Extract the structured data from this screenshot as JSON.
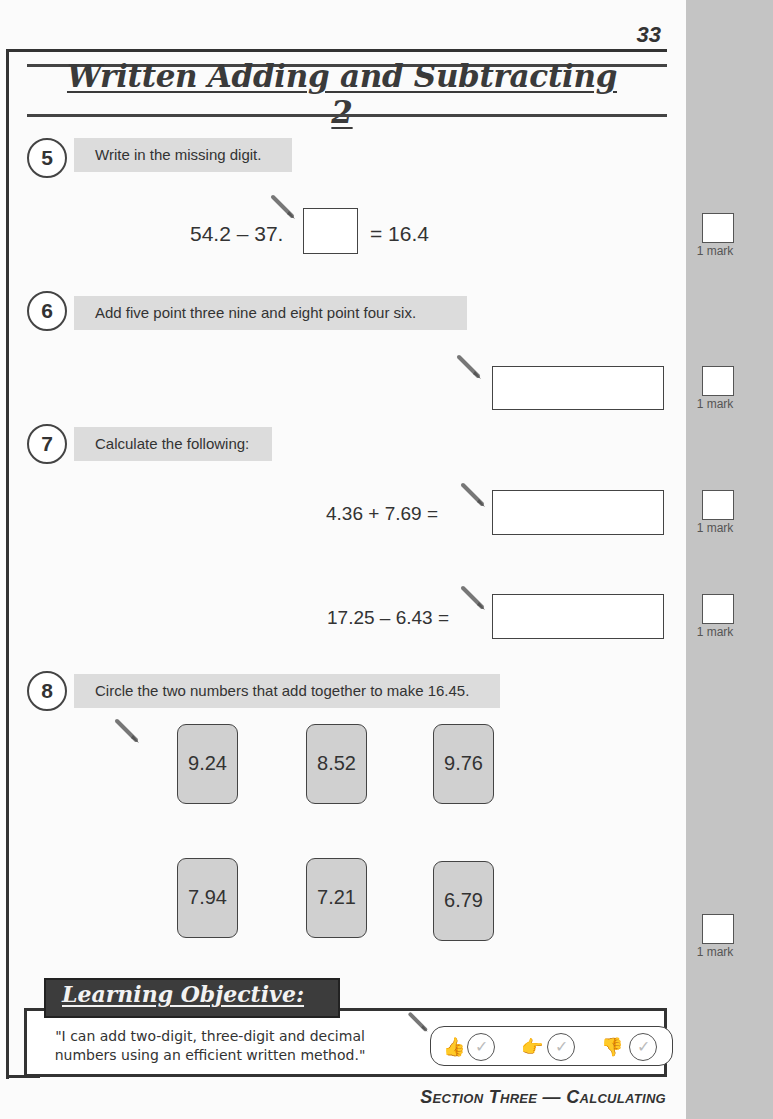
{
  "page": {
    "number": "33",
    "title": "Written Adding and Subtracting 2",
    "footer": "Section Three — Calculating"
  },
  "questions": [
    {
      "number": "5",
      "prompt": "Write in the missing digit.",
      "equation": {
        "left": "54.2  –  37.",
        "right": "=  16.4"
      },
      "mark": "1 mark"
    },
    {
      "number": "6",
      "prompt": "Add five point three nine and eight point four six.",
      "mark": "1 mark"
    },
    {
      "number": "7",
      "prompt": "Calculate the following:",
      "parts": [
        {
          "expression": "4.36 + 7.69 =",
          "mark": "1 mark"
        },
        {
          "expression": "17.25 – 6.43 =",
          "mark": "1 mark"
        }
      ]
    },
    {
      "number": "8",
      "prompt": "Circle the two numbers that add together to make 16.45.",
      "cards": [
        "9.24",
        "8.52",
        "9.76",
        "7.94",
        "7.21",
        "6.79"
      ],
      "mark": "1 mark"
    }
  ],
  "learning_objective": {
    "heading": "Learning Objective:",
    "text": "\"I can add two-digit, three-digit and decimal numbers using an efficient written method.\"",
    "self_assessment": [
      {
        "icon": "thumbs-up-icon",
        "glyph": "👍",
        "check": "✓"
      },
      {
        "icon": "thumbs-sideways-icon",
        "glyph": "👉",
        "check": "✓"
      },
      {
        "icon": "thumbs-down-icon",
        "glyph": "👎",
        "check": "✓"
      }
    ]
  },
  "colors": {
    "sidebar": "#c4c4c4",
    "prompt_bg": "#dcdcdc",
    "card_bg": "#d0d0d0",
    "lo_tab": "#3c3c3c",
    "ink": "#333333"
  }
}
